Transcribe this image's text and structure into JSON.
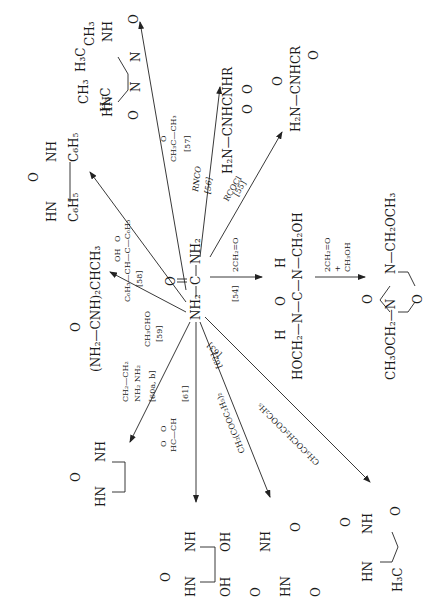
{
  "figure": {
    "orientation": "rotated-90-ccw",
    "center_compound": {
      "left": "NH₂",
      "carbonyl": "O",
      "c": "C",
      "right": "NH₂"
    },
    "reactions": [
      {
        "ref": "[54]",
        "reagent": "2CH₂=O",
        "product": {
          "top_h": "H",
          "top_o": "O",
          "top_h2": "H",
          "line": "HOCH₂—N—C—N—CH₂OH"
        }
      },
      {
        "ref": "",
        "reagent": "2CH₂=O",
        "reagent2": "+",
        "reagent3": "CH₃OH",
        "product": {
          "left": "CH₃OCH₂—N",
          "right": "N—CH₂OCH₃",
          "o": "O",
          "ring_o": "O"
        }
      },
      {
        "ref": "[55]",
        "reagent": "RCOCl",
        "product": {
          "main": "H₂N—CNHCR",
          "o1": "O",
          "o2": "O"
        }
      },
      {
        "ref": "[56]",
        "reagent": "RNCO",
        "product": {
          "main": "H₂N—CNHCNHR",
          "o1": "O",
          "o2": "O"
        }
      },
      {
        "ref": "[57]",
        "reagent": "CH₃C—CH₃",
        "reagent_o": "O",
        "product": {
          "ch3_a": "CH₃",
          "h3c_a": "H₃C",
          "h3c_b": "H₃C",
          "ch3_b": "CH₃",
          "nh_a": "NH",
          "nh_b": "N",
          "nh_b_h": "H",
          "hn_a": "HN",
          "n_c": "N",
          "n_c_h": "H",
          "o_a": "O",
          "o_b": "O"
        }
      },
      {
        "ref": "[58]",
        "reagent": "C₆H₅—CH—C—C₆H₅",
        "reagent_oh": "OH",
        "reagent_o": "O",
        "product": {
          "nh": "NH",
          "hn": "HN",
          "o": "O",
          "ph1": "C₆H₅",
          "ph2": "C₆H₅"
        }
      },
      {
        "ref": "[59]",
        "reagent": "CH₃CHO",
        "product": {
          "main": "(NH₂—CNH)₂CHCH₃",
          "o": "O"
        }
      },
      {
        "ref": "[60a, b]",
        "reagent_top": "CH₂—CH₂",
        "reagent_bottom": "NH₂   NH₂",
        "product": {
          "nh": "NH",
          "hn": "HN",
          "o": "O"
        }
      },
      {
        "ref": "[61]",
        "reagent": "HC—CH",
        "reagent_o1": "O",
        "reagent_o2": "O",
        "product": {
          "nh": "NH",
          "hn": "HN",
          "o": "O",
          "oh1": "OH",
          "oh2": "OH"
        }
      },
      {
        "ref": "[62]",
        "reagent": "CH₂(COOC₂H₅)₂",
        "product": {
          "nh": "NH",
          "hn": "HN",
          "o1": "O",
          "o2": "O",
          "o3": "O"
        }
      },
      {
        "ref": "[63]",
        "reagent": "CH₃COCH₂COOC₂H₅",
        "product": {
          "nh": "NH",
          "hn": "HN",
          "o1": "O",
          "o2": "O",
          "me": "H₃C"
        }
      }
    ]
  }
}
